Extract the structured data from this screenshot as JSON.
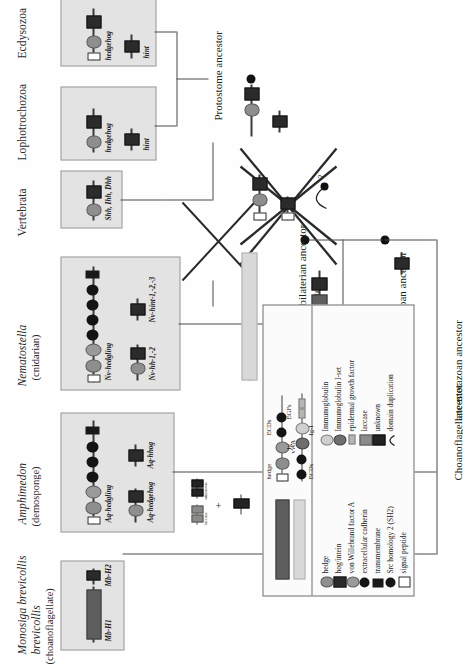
{
  "figure": {
    "type": "phylogenetic-domain-architecture-diagram"
  },
  "taxa": [
    {
      "name": "Monosiga brevicollis",
      "common": "(choanoflagellate)",
      "genes": [
        "Mb-H1",
        "Mb-H2"
      ]
    },
    {
      "name": "Amphimedon",
      "common": "(demosponge)",
      "genes": [
        "Aq-hedgling",
        "Aq-hedgehog",
        "Aq-hhog"
      ]
    },
    {
      "name": "Nematostella",
      "common": "(cnidarian)",
      "genes": [
        "Nv-hedgling",
        "Nv-hh-1,-2",
        "Nv-hint-1,-2,-3"
      ]
    },
    {
      "name": "Vertebrata",
      "common": "",
      "genes": [
        "Shh, Ihh, Dhh"
      ]
    },
    {
      "name": "Lophotrochozoa",
      "common": "",
      "genes": [
        "hedgehog",
        "hint"
      ]
    },
    {
      "name": "Ecdysozoa",
      "common": "",
      "genes": [
        "hedgehog",
        "hint"
      ]
    }
  ],
  "ancestors": {
    "protostome": "Protostome ancestor",
    "cnidarian_bilaterian": "Cnidarian-bilaterian ancestor",
    "metazoan": "Metazoan ancestor",
    "choano_metazoan": "Choanoflagellate-metazoan ancestor"
  },
  "annotations": {
    "duplication": "dupl.",
    "question": "?",
    "plus": "+",
    "laccase_small": "laccase",
    "unknown_small": "unknown"
  },
  "legend": {
    "left_column": [
      {
        "symbol": "hedge",
        "label": "hedge"
      },
      {
        "symbol": "hog-intein",
        "label": "hog/intein"
      },
      {
        "symbol": "von-willebrand-factor-a",
        "label": "von Willebrand factor A"
      },
      {
        "symbol": "extracellular-cadherin",
        "label": "extracellular cadherin"
      },
      {
        "symbol": "transmembrane",
        "label": "transmembrane"
      },
      {
        "symbol": "src-homology-2",
        "label": "Src homology 2 (SH2)"
      },
      {
        "symbol": "signal-peptide",
        "label": "signal peptide"
      }
    ],
    "right_column": [
      {
        "symbol": "immunoglobulin",
        "label": "Immunoglobulin"
      },
      {
        "symbol": "immunoglobulin-i-set",
        "label": "Immunoglobulin I-set"
      },
      {
        "symbol": "epidermal-growth-factor",
        "label": "epidermal growth factor"
      },
      {
        "symbol": "laccase",
        "label": "laccase"
      },
      {
        "symbol": "unknown",
        "label": "unknown"
      },
      {
        "symbol": "domain-duplication",
        "label": "domain duplication"
      }
    ],
    "schematic_labels": {
      "hedge": "hedge",
      "vwa": "vWA",
      "ecds_top": "ECDs",
      "ig": "Ig",
      "egfs": "EGFs",
      "ecds_bottom": "ECDs",
      "ig_i": "Ig-I"
    }
  },
  "colors": {
    "hedge": "#8e8e8e",
    "hog": "#2b2b2b",
    "vwa": "#9a9a9a",
    "ecd": "#141414",
    "transmembrane": "#191919",
    "sh2": "#141414",
    "signal_peptide": "#ffffff",
    "immunoglobulin": "#cfcfcf",
    "immunoglobulin_i_set": "#6e6e6e",
    "egf": "#b5b5b5",
    "laccase": "#8a8a8a",
    "unknown": "#232323",
    "panel_background": "#e3e3e3",
    "line": "#4a4a4a"
  }
}
